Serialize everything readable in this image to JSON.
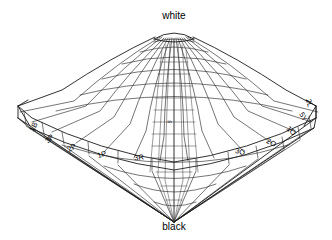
{
  "figure": {
    "shape": "double-cone wireframe",
    "background_color": "#ffffff",
    "line_color": "#1a1a1a",
    "grid_color": "#2b2b2b"
  },
  "poles": {
    "top": {
      "label": "white",
      "x": 174,
      "y": 19
    },
    "bottom": {
      "label": "black",
      "x": 174,
      "y": 230
    }
  },
  "axis": {
    "marker_label": "5",
    "marker_x": 170,
    "marker_y": 122
  },
  "hue_labels": [
    {
      "text": "1B",
      "x": 34,
      "y": 127,
      "rotate": -62
    },
    {
      "text": "3P",
      "x": 50,
      "y": 139,
      "rotate": -46
    },
    {
      "text": "2P",
      "x": 72,
      "y": 148,
      "rotate": -32
    },
    {
      "text": "1P",
      "x": 102,
      "y": 155,
      "rotate": -19
    },
    {
      "text": "3R",
      "x": 139,
      "y": 158,
      "rotate": -8
    },
    {
      "text": "3O",
      "x": 240,
      "y": 152,
      "rotate": 14
    },
    {
      "text": "2O",
      "x": 271,
      "y": 143,
      "rotate": 26
    },
    {
      "text": "1O",
      "x": 291,
      "y": 131,
      "rotate": 42
    },
    {
      "text": "5Y",
      "x": 303,
      "y": 117,
      "rotate": 60
    },
    {
      "text": "2L",
      "x": 309,
      "y": 103,
      "rotate": 76
    }
  ],
  "geometry": {
    "center_x": 174,
    "top_y": 30,
    "bottom_y": 222,
    "equator_y": 118,
    "left_tip_x": 18,
    "right_tip_x": 316,
    "cap_half_width": 20,
    "cap_y": 34,
    "rim_rings": 5,
    "radial_meridians": 20
  },
  "colors": {
    "ink": "#1a1a1a",
    "grid": "#2b2b2b",
    "fine": "#3a3a3a",
    "paper": "#ffffff"
  }
}
